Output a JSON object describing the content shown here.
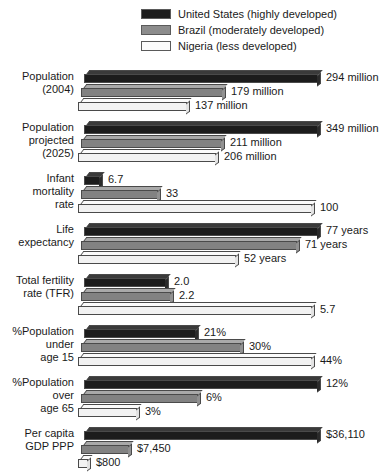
{
  "legend": {
    "items": [
      {
        "label": "United States (highly developed)",
        "color": "#1c1c1c",
        "swatch": "legend-swatch-united-states"
      },
      {
        "label": "Brazil (moderately developed)",
        "color": "#8c8c8c",
        "swatch": "legend-swatch-brazil"
      },
      {
        "label": "Nigeria (less developed)",
        "color": "#fbfbfb",
        "swatch": "legend-swatch-nigeria"
      }
    ]
  },
  "chart_data": {
    "type": "bar",
    "orientation": "horizontal",
    "title": "",
    "xlabel": "",
    "ylabel": "",
    "grid": false,
    "legend_position": "top",
    "note": "Each indicator row is scaled independently to its own maximum value.",
    "series_names": [
      "United States (highly developed)",
      "Brazil (moderately developed)",
      "Nigeria (less developed)"
    ],
    "categories": [
      "Population (2004)",
      "Population projected (2025)",
      "Infant mortality rate",
      "Life expectancy",
      "Total fertility rate (TFR)",
      "%Population under age 15",
      "%Population over age 65",
      "Per capita GDP PPP"
    ],
    "series": [
      {
        "name": "United States (highly developed)",
        "values": [
          294,
          349,
          6.7,
          77,
          2.0,
          21,
          12,
          36110
        ]
      },
      {
        "name": "Brazil (moderately developed)",
        "values": [
          179,
          211,
          33,
          71,
          2.2,
          30,
          6,
          7450
        ]
      },
      {
        "name": "Nigeria (less developed)",
        "values": [
          137,
          206,
          100,
          52,
          5.7,
          44,
          3,
          800
        ]
      }
    ],
    "groups": [
      {
        "label_lines": [
          "Population",
          "(2004)"
        ],
        "max": 294,
        "bars": [
          {
            "series": "United States (highly developed)",
            "value": 294,
            "display": "294 million"
          },
          {
            "series": "Brazil (moderately developed)",
            "value": 179,
            "display": "179 million"
          },
          {
            "series": "Nigeria (less developed)",
            "value": 137,
            "display": "137 million"
          }
        ]
      },
      {
        "label_lines": [
          "Population",
          "projected",
          "(2025)"
        ],
        "max": 349,
        "bars": [
          {
            "series": "United States (highly developed)",
            "value": 349,
            "display": "349 million"
          },
          {
            "series": "Brazil (moderately developed)",
            "value": 211,
            "display": "211 million"
          },
          {
            "series": "Nigeria (less developed)",
            "value": 206,
            "display": "206 million"
          }
        ]
      },
      {
        "label_lines": [
          "Infant",
          "mortality",
          "rate"
        ],
        "max": 100,
        "bars": [
          {
            "series": "United States (highly developed)",
            "value": 6.7,
            "display": "6.7"
          },
          {
            "series": "Brazil (moderately developed)",
            "value": 33,
            "display": "33"
          },
          {
            "series": "Nigeria (less developed)",
            "value": 100,
            "display": "100"
          }
        ]
      },
      {
        "label_lines": [
          "Life",
          "expectancy"
        ],
        "max": 77,
        "bars": [
          {
            "series": "United States (highly developed)",
            "value": 77,
            "display": "77 years"
          },
          {
            "series": "Brazil (moderately developed)",
            "value": 71,
            "display": "71 years"
          },
          {
            "series": "Nigeria (less developed)",
            "value": 52,
            "display": "52 years"
          }
        ]
      },
      {
        "label_lines": [
          "Total fertility",
          "rate (TFR)"
        ],
        "max": 5.7,
        "bars": [
          {
            "series": "United States (highly developed)",
            "value": 2.0,
            "display": "2.0"
          },
          {
            "series": "Brazil (moderately developed)",
            "value": 2.2,
            "display": "2.2"
          },
          {
            "series": "Nigeria (less developed)",
            "value": 5.7,
            "display": "5.7"
          }
        ]
      },
      {
        "label_lines": [
          "%Population",
          "under",
          "age 15"
        ],
        "max": 44,
        "bars": [
          {
            "series": "United States (highly developed)",
            "value": 21,
            "display": "21%"
          },
          {
            "series": "Brazil (moderately developed)",
            "value": 30,
            "display": "30%"
          },
          {
            "series": "Nigeria (less developed)",
            "value": 44,
            "display": "44%"
          }
        ]
      },
      {
        "label_lines": [
          "%Population",
          "over",
          "age 65"
        ],
        "max": 12,
        "bars": [
          {
            "series": "United States (highly developed)",
            "value": 12,
            "display": "12%"
          },
          {
            "series": "Brazil (moderately developed)",
            "value": 6,
            "display": "6%"
          },
          {
            "series": "Nigeria (less developed)",
            "value": 3,
            "display": "3%"
          }
        ]
      },
      {
        "label_lines": [
          "Per capita",
          "GDP PPP"
        ],
        "max": 36110,
        "bars": [
          {
            "series": "United States (highly developed)",
            "value": 36110,
            "display": "$36,110"
          },
          {
            "series": "Brazil (moderately developed)",
            "value": 7450,
            "display": "$7,450"
          },
          {
            "series": "Nigeria (less developed)",
            "value": 800,
            "display": "$800"
          }
        ]
      }
    ]
  }
}
